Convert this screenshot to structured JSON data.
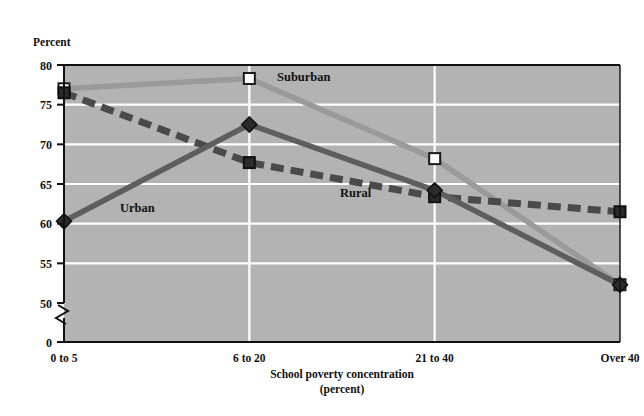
{
  "chart_data": {
    "type": "line",
    "title": "",
    "ylabel": "Percent",
    "xlabel": "School poverty concentration",
    "xlabel_sub": "(percent)",
    "categories": [
      "0 to 5",
      "6 to 20",
      "21 to 40",
      "Over 40"
    ],
    "ylim": [
      50,
      80
    ],
    "yticks": [
      "0",
      "50",
      "55",
      "60",
      "65",
      "70",
      "75",
      "80"
    ],
    "yticks_values": [
      0,
      50,
      55,
      60,
      65,
      70,
      75,
      80
    ],
    "axis_break": true,
    "grid": "horizontal-and-vertical-white",
    "legend": "inline-labels",
    "series": [
      {
        "name": "Suburban",
        "values": [
          77.0,
          78.3,
          68.2,
          52.3
        ],
        "color": "#9a9a9a",
        "marker": "open-square",
        "line": "solid"
      },
      {
        "name": "Urban",
        "values": [
          60.3,
          72.5,
          64.2,
          52.3
        ],
        "color": "#5e5e5e",
        "marker": "filled-diamond",
        "line": "solid"
      },
      {
        "name": "Rural",
        "values": [
          76.5,
          67.7,
          63.4,
          61.5
        ],
        "color": "#4a4a4a",
        "marker": "filled-square",
        "line": "dashed"
      }
    ]
  },
  "colors": {
    "plot_background": "#b3b3b3",
    "gridline": "#ffffff",
    "axis": "#111111",
    "page_background": "#ffffff"
  }
}
